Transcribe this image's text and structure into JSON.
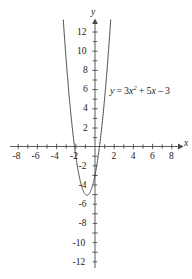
{
  "figure": {
    "background_color": "#ffffff",
    "curve_color": "#3a3a3a",
    "axis_color": "#4a4a4a"
  },
  "axes": {
    "x_axis_name": "x",
    "y_axis_name": "y",
    "x_tick_labels": [
      "-8",
      "-6",
      "-4",
      "-2",
      "2",
      "4",
      "6",
      "8"
    ],
    "y_tick_labels": [
      "12",
      "10",
      "8",
      "6",
      "4",
      "2",
      "-2",
      "-4",
      "-6",
      "-8",
      "-10",
      "-12"
    ]
  },
  "annotation": {
    "equation_plain": "y = 3x^2 + 5x - 3",
    "lhs": "y",
    "equals": "=",
    "coef_a": "3",
    "var_x": "x",
    "exponent": "2",
    "plus": "+",
    "coef_b": "5",
    "minus": "–",
    "coef_c": "3"
  },
  "chart_data": {
    "type": "line",
    "title": "",
    "xlabel": "x",
    "ylabel": "y",
    "xlim": [
      -8.5,
      8.5
    ],
    "ylim": [
      -12.5,
      13.2
    ],
    "grid": false,
    "legend": null,
    "annotations": [
      "y = 3x² + 5x – 3"
    ],
    "x_ticks": [
      -8,
      -7,
      -6,
      -5,
      -4,
      -3,
      -2,
      -1,
      1,
      2,
      3,
      4,
      5,
      6,
      7,
      8
    ],
    "x_tick_labeled": [
      -8,
      -6,
      -4,
      -2,
      2,
      4,
      6,
      8
    ],
    "y_ticks": [
      -12,
      -11,
      -10,
      -9,
      -8,
      -7,
      -6,
      -5,
      -4,
      -3,
      -2,
      -1,
      1,
      2,
      3,
      4,
      5,
      6,
      7,
      8,
      9,
      10,
      11,
      12
    ],
    "y_tick_labeled": [
      12,
      10,
      8,
      6,
      4,
      2,
      -2,
      -4,
      -6,
      -8,
      -10,
      -12
    ],
    "series": [
      {
        "name": "y = 3x^2 + 5x - 3",
        "function": "3*x^2 + 5*x - 3",
        "vertex": [
          -0.833,
          -5.083
        ],
        "roots": [
          -2.137,
          0.471
        ],
        "y_intercept": -3,
        "x": [
          -2.95,
          -2.8,
          -2.6,
          -2.4,
          -2.2,
          -2.0,
          -1.8,
          -1.6,
          -1.4,
          -1.2,
          -1.0,
          -0.833,
          -0.6,
          -0.4,
          -0.2,
          0.0,
          0.2,
          0.4,
          0.6,
          0.8,
          1.0,
          1.2,
          1.4,
          1.5
        ],
        "y": [
          8.36,
          6.52,
          4.28,
          2.28,
          0.52,
          -1.0,
          -2.28,
          -3.32,
          -4.12,
          -4.68,
          -5.0,
          -5.083,
          -4.92,
          -4.52,
          -3.88,
          -3.0,
          -1.88,
          -0.52,
          1.08,
          2.92,
          5.0,
          7.32,
          9.88,
          11.25
        ]
      }
    ]
  }
}
